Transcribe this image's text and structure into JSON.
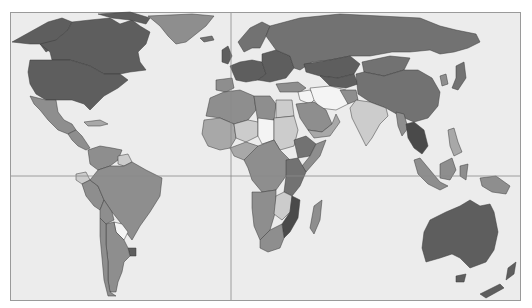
{
  "map": {
    "type": "choropleth-world",
    "projection": "equirectangular-like",
    "palette": {
      "ocean": "#ececec",
      "frame": "#9a9a9a",
      "gridline": "#8a8a8a",
      "border": "#3a3a3a",
      "very_dark": "#4a4a4a",
      "dark": "#5e5e5e",
      "medium_dark": "#727272",
      "medium": "#8e8e8e",
      "light": "#a8a8a8",
      "very_light": "#cccccc",
      "white": "#f4f4f4"
    },
    "gridlines": {
      "equator_y": 176,
      "prime_meridian_x": 231
    },
    "regions": [
      {
        "id": "canada",
        "shade": "#5e5e5e"
      },
      {
        "id": "usa",
        "shade": "#5e5e5e"
      },
      {
        "id": "alaska",
        "shade": "#5e5e5e"
      },
      {
        "id": "greenland",
        "shade": "#8e8e8e"
      },
      {
        "id": "mexico",
        "shade": "#8e8e8e"
      },
      {
        "id": "central-america",
        "shade": "#8e8e8e"
      },
      {
        "id": "caribbean",
        "shade": "#a8a8a8"
      },
      {
        "id": "colombia-venezuela",
        "shade": "#8e8e8e"
      },
      {
        "id": "guianas",
        "shade": "#cccccc"
      },
      {
        "id": "ecuador",
        "shade": "#cccccc"
      },
      {
        "id": "peru",
        "shade": "#8e8e8e"
      },
      {
        "id": "brazil",
        "shade": "#8e8e8e"
      },
      {
        "id": "bolivia",
        "shade": "#8e8e8e"
      },
      {
        "id": "paraguay",
        "shade": "#f4f4f4"
      },
      {
        "id": "uruguay",
        "shade": "#5e5e5e"
      },
      {
        "id": "chile",
        "shade": "#8e8e8e"
      },
      {
        "id": "argentina",
        "shade": "#8e8e8e"
      },
      {
        "id": "iceland",
        "shade": "#727272"
      },
      {
        "id": "uk",
        "shade": "#5e5e5e"
      },
      {
        "id": "scandinavia",
        "shade": "#727272"
      },
      {
        "id": "western-europe",
        "shade": "#5e5e5e"
      },
      {
        "id": "iberia",
        "shade": "#8e8e8e"
      },
      {
        "id": "eastern-europe",
        "shade": "#5e5e5e"
      },
      {
        "id": "russia",
        "shade": "#727272"
      },
      {
        "id": "kazakhstan",
        "shade": "#5e5e5e"
      },
      {
        "id": "central-asia",
        "shade": "#5e5e5e"
      },
      {
        "id": "turkey",
        "shade": "#8e8e8e"
      },
      {
        "id": "middle-east",
        "shade": "#f4f4f4"
      },
      {
        "id": "saudi-arabia",
        "shade": "#8e8e8e"
      },
      {
        "id": "yemen-oman",
        "shade": "#a8a8a8"
      },
      {
        "id": "iran",
        "shade": "#f4f4f4"
      },
      {
        "id": "afghanistan",
        "shade": "#8e8e8e"
      },
      {
        "id": "india",
        "shade": "#cccccc"
      },
      {
        "id": "china",
        "shade": "#727272"
      },
      {
        "id": "mongolia",
        "shade": "#727272"
      },
      {
        "id": "japan",
        "shade": "#727272"
      },
      {
        "id": "korea",
        "shade": "#8e8e8e"
      },
      {
        "id": "myanmar",
        "shade": "#8e8e8e"
      },
      {
        "id": "thailand-indochina",
        "shade": "#4a4a4a"
      },
      {
        "id": "malaysia-indonesia",
        "shade": "#8e8e8e"
      },
      {
        "id": "philippines",
        "shade": "#a8a8a8"
      },
      {
        "id": "papua",
        "shade": "#8e8e8e"
      },
      {
        "id": "australia",
        "shade": "#5e5e5e"
      },
      {
        "id": "new-zealand",
        "shade": "#5e5e5e"
      },
      {
        "id": "north-africa-west",
        "shade": "#8e8e8e"
      },
      {
        "id": "libya",
        "shade": "#8e8e8e"
      },
      {
        "id": "egypt",
        "shade": "#cccccc"
      },
      {
        "id": "west-africa",
        "shade": "#a8a8a8"
      },
      {
        "id": "sahel",
        "shade": "#cccccc"
      },
      {
        "id": "chad",
        "shade": "#f4f4f4"
      },
      {
        "id": "sudan",
        "shade": "#cccccc"
      },
      {
        "id": "ethiopia",
        "shade": "#727272"
      },
      {
        "id": "somalia",
        "shade": "#8e8e8e"
      },
      {
        "id": "central-africa",
        "shade": "#8e8e8e"
      },
      {
        "id": "east-africa",
        "shade": "#727272"
      },
      {
        "id": "angola-namibia",
        "shade": "#8e8e8e"
      },
      {
        "id": "zambia-zimbabwe",
        "shade": "#cccccc"
      },
      {
        "id": "mozambique",
        "shade": "#4a4a4a"
      },
      {
        "id": "south-africa",
        "shade": "#8e8e8e"
      },
      {
        "id": "madagascar",
        "shade": "#8e8e8e"
      }
    ]
  }
}
